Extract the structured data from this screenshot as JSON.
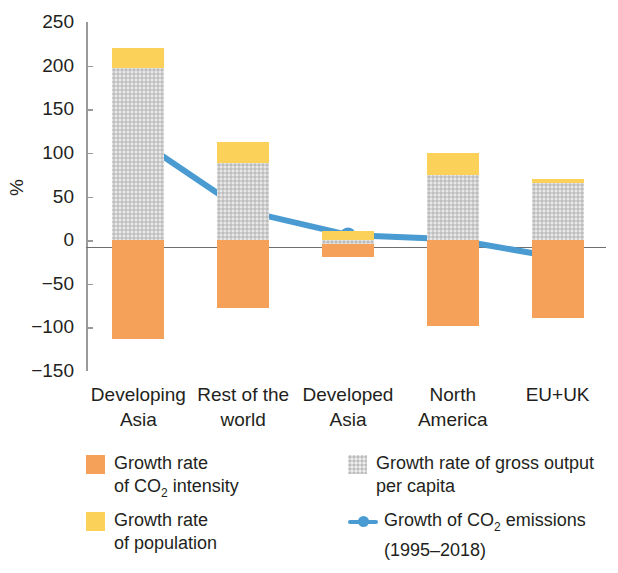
{
  "chart_data": {
    "type": "bar",
    "title": "",
    "subtitle": "",
    "xlabel": "",
    "ylabel": "%",
    "ylim": [
      -150,
      250
    ],
    "yticks": [
      "250",
      "200",
      "150",
      "100",
      "50",
      "0",
      "-50",
      "-100",
      "-150"
    ],
    "ytick_values": [
      250,
      200,
      150,
      100,
      50,
      0,
      -50,
      -100,
      -150
    ],
    "grid": false,
    "legend_position": "bottom",
    "stacked": true,
    "categories": [
      "Developing Asia",
      "Rest of the world",
      "Developed Asia",
      "North America",
      "EU+UK"
    ],
    "category_lines": [
      [
        "Developing",
        "Asia"
      ],
      [
        "Rest of the",
        "world"
      ],
      [
        "Developed",
        "Asia"
      ],
      [
        "North",
        "America"
      ],
      [
        "EU+UK"
      ]
    ],
    "series": [
      {
        "name": "Growth rate of CO2 intensity",
        "color": "#f6a15a",
        "values": [
          -113,
          -78,
          -15,
          -98,
          -89
        ]
      },
      {
        "name": "Growth rate of gross output per capita",
        "color": "#cfcfcf",
        "values": [
          197,
          88,
          -4,
          75,
          65
        ]
      },
      {
        "name": "Growth rate of population",
        "color": "#fcd159",
        "values": [
          23,
          24,
          10,
          25,
          5
        ]
      }
    ],
    "line_series": {
      "name": "Growth of CO2 emissions (1995-2018)",
      "color": "#4a9bd1",
      "values": [
        115,
        34,
        6,
        1,
        -20
      ]
    }
  },
  "legend": {
    "items": [
      {
        "key": "co2-intensity",
        "swatch": "orange",
        "line1_a": "Growth rate",
        "line2_a": "of CO",
        "line2_sub": "2",
        "line2_b": " intensity"
      },
      {
        "key": "population",
        "swatch": "yellow",
        "line1_a": "Growth rate",
        "line2_a": "of population",
        "line2_sub": "",
        "line2_b": ""
      },
      {
        "key": "gross-output",
        "swatch": "gray",
        "line1_a": "Growth rate of gross output",
        "line2_a": "per capita",
        "line2_sub": "",
        "line2_b": ""
      },
      {
        "key": "co2-emissions",
        "swatch": "line",
        "line1_a": "Growth of CO",
        "line1_sub": "2",
        "line1_b": " emissions",
        "line2_a": "(1995–2018)",
        "line2_sub": "",
        "line2_b": ""
      }
    ]
  }
}
